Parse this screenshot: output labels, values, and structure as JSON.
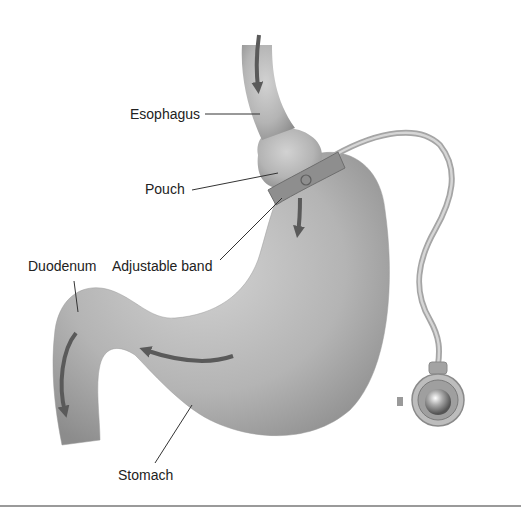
{
  "diagram": {
    "labels": [
      {
        "id": "esophagus",
        "text": "Esophagus"
      },
      {
        "id": "pouch",
        "text": "Pouch"
      },
      {
        "id": "adjustable_band",
        "text": "Adjustable band"
      },
      {
        "id": "duodenum",
        "text": "Duodenum"
      },
      {
        "id": "stomach",
        "text": "Stomach"
      }
    ],
    "parts": [
      "esophagus",
      "pouch",
      "adjustable band",
      "tube",
      "access port",
      "stomach",
      "duodenum"
    ],
    "arrows": [
      "food-flow-esophagus",
      "food-flow-band",
      "food-flow-stomach",
      "food-flow-duodenum"
    ],
    "colors": {
      "organ": "#b8b8b8",
      "organ_dark": "#8a8a8a",
      "arrow": "#5a5a5a",
      "line": "#333333",
      "rule": "#9a9a9a"
    }
  }
}
